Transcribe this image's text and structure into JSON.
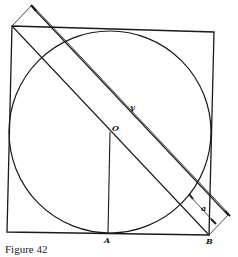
{
  "figure": {
    "caption": "Figure 42",
    "labels": {
      "y": "y",
      "O": "O",
      "A": "A",
      "B": "B",
      "a": "a"
    },
    "geometry": {
      "square": [
        [
          12,
          26
        ],
        [
          214,
          32
        ],
        [
          209,
          235
        ],
        [
          7,
          232
        ]
      ],
      "circle": {
        "cx": 110,
        "cy": 132,
        "r": 101
      },
      "diagonal": [
        [
          12,
          26
        ],
        [
          209,
          235
        ]
      ],
      "parallel_line": [
        [
          34,
          9
        ],
        [
          228,
          215
        ]
      ],
      "radius_segment": [
        [
          110,
          132
        ],
        [
          108,
          233
        ]
      ]
    },
    "colors": {
      "stroke": "#1a1a1a",
      "background": "#ffffff"
    }
  }
}
